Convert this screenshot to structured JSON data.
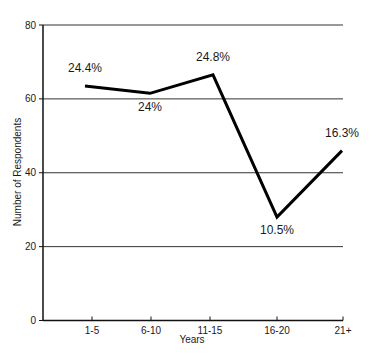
{
  "chart_data": {
    "type": "line",
    "title": "",
    "xlabel": "Years",
    "ylabel": "Number of Respondents",
    "categories": [
      "1-5",
      "6-10",
      "11-15",
      "16-20",
      "21+"
    ],
    "values": [
      63.5,
      61.5,
      66.5,
      28,
      46
    ],
    "data_labels": [
      "24.4%",
      "24%",
      "24.8%",
      "10.5%",
      "16.3%"
    ],
    "ylim": [
      0,
      80
    ],
    "yticks": [
      0,
      20,
      40,
      60,
      80
    ],
    "grid": true,
    "legend": null,
    "line_color": "#000000"
  }
}
